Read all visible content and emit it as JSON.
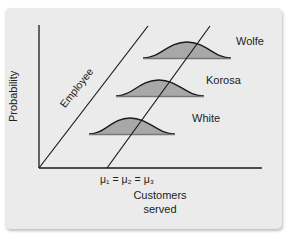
{
  "diagram": {
    "axes": {
      "y_label": "Probability",
      "x_label_line1": "Customers",
      "x_label_line2": "served",
      "x_tick_label": "μ₁ = μ₂ = μ₃"
    },
    "lines": {
      "employee_label": "Employee"
    },
    "distributions": [
      {
        "name": "Wolfe"
      },
      {
        "name": "Korosa"
      },
      {
        "name": "White"
      }
    ],
    "colors": {
      "panel_bg": "#ebebeb",
      "curve_fill": "#a8a8a8",
      "line": "#1a1a1a"
    }
  }
}
